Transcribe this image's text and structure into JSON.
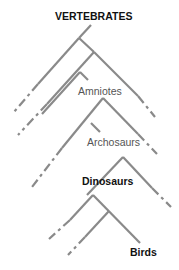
{
  "title": "VERTEBRATES",
  "clades": [
    {
      "name": "Amniotes",
      "style": "light"
    },
    {
      "name": "Archosaurs",
      "style": "light"
    },
    {
      "name": "Dinosaurs",
      "style": "bold"
    },
    {
      "name": "Birds",
      "style": "bold"
    }
  ],
  "colors": {
    "line": "#8a8a8a",
    "text": "#111111",
    "label_light": "#555555"
  }
}
